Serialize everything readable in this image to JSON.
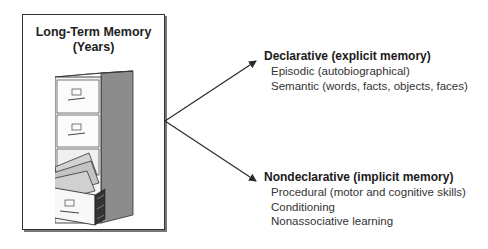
{
  "memory_box": {
    "title_line1": "Long-Term Memory",
    "title_line2": "(Years)",
    "icon": "filing-cabinet-icon"
  },
  "branches": [
    {
      "heading": "Declarative (explicit memory)",
      "items": [
        "Episodic (autobiographical)",
        "Semantic (words, facts, objects, faces)"
      ]
    },
    {
      "heading": "Nondeclarative (implicit memory)",
      "items": [
        "Procedural (motor and cognitive skills)",
        "Conditioning",
        "Nonassociative learning"
      ]
    }
  ],
  "colors": {
    "line": "#2a2a2a",
    "cabinet_side": "#8a8a8a",
    "folders": "#c8c8c8"
  }
}
